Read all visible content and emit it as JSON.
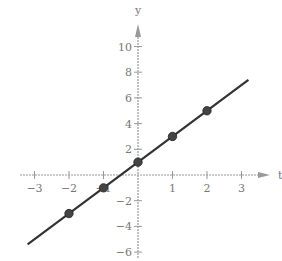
{
  "chart_data": {
    "type": "line",
    "title": "",
    "xlabel": "t",
    "ylabel": "y",
    "equation": "y = 2t + 1",
    "x_ticks": [
      -3,
      -2,
      -1,
      1,
      2,
      3
    ],
    "x_tick_labels": [
      "−3",
      "−2",
      "1",
      "2",
      "3"
    ],
    "y_ticks": [
      10,
      8,
      6,
      4,
      2,
      -2,
      -4,
      -6
    ],
    "y_tick_labels": [
      "10",
      "8",
      "6",
      "4",
      "2",
      "−2",
      "−4",
      "−6"
    ],
    "xlim": [
      -3.5,
      3.8
    ],
    "ylim": [
      -6.5,
      11
    ],
    "grid": false,
    "series": [
      {
        "name": "line",
        "style": "solid line",
        "x": [
          -3.2,
          3.2
        ],
        "y": [
          -5.4,
          7.4
        ]
      },
      {
        "name": "points",
        "style": "markers",
        "x": [
          -2,
          -1,
          0,
          1,
          2
        ],
        "y": [
          -3,
          -1,
          1,
          3,
          5
        ]
      }
    ],
    "colors": {
      "line": "#333333",
      "axis": "#999999",
      "points": "#444444"
    }
  }
}
